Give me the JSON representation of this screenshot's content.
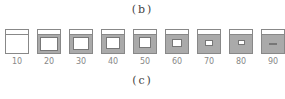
{
  "caption_top": "(b)",
  "caption_bottom": "(c)",
  "colors": {
    "fill": "#aaaaaa",
    "outline": "#888888"
  },
  "items": [
    {
      "label": "10",
      "x": 5,
      "hole": [
        0,
        5,
        22,
        18
      ]
    },
    {
      "label": "20",
      "x": 37,
      "hole": [
        2,
        7,
        18,
        14
      ]
    },
    {
      "label": "30",
      "x": 69,
      "hole": [
        3,
        7,
        16,
        13
      ]
    },
    {
      "label": "40",
      "x": 101,
      "hole": [
        4,
        7,
        14,
        12
      ]
    },
    {
      "label": "50",
      "x": 133,
      "hole": [
        5,
        7,
        12,
        11
      ]
    },
    {
      "label": "60",
      "x": 165,
      "hole": [
        6,
        9,
        10,
        8
      ]
    },
    {
      "label": "70",
      "x": 197,
      "hole": [
        7,
        10,
        8,
        6
      ]
    },
    {
      "label": "80",
      "x": 229,
      "hole": [
        8,
        10,
        7,
        5
      ]
    },
    {
      "label": "90",
      "x": 261,
      "hole": [
        7,
        13,
        8,
        2
      ]
    }
  ]
}
